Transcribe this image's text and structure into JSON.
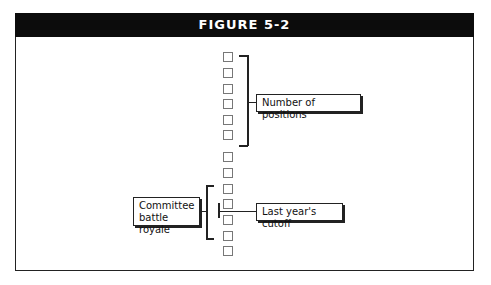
{
  "figure": {
    "title": "FIGURE 5-2"
  },
  "diagram": {
    "square_count": 13,
    "labels": {
      "positions": "Number of positions",
      "committee_line1": "Committee",
      "committee_line2": "battle royale",
      "cutoff": "Last year's cutoff"
    },
    "colors": {
      "header_bg": "#0c0c0c",
      "header_text": "#ffffff",
      "lines": "#222222",
      "squares": "#777777"
    }
  }
}
